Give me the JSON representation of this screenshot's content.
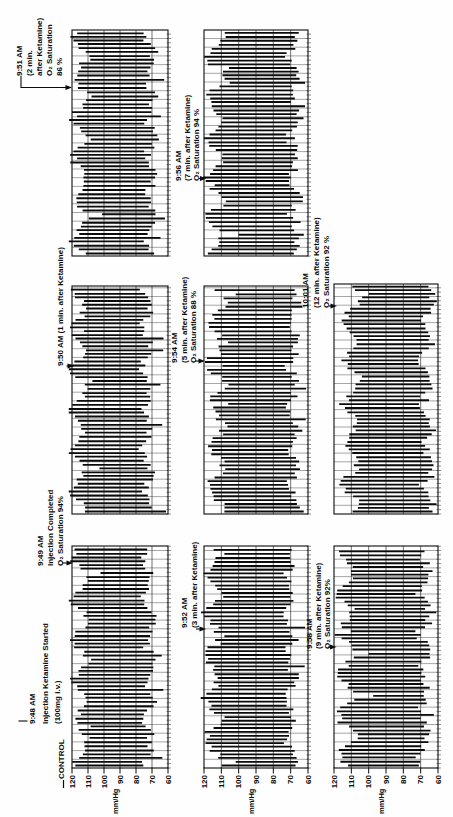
{
  "figure": {
    "y_axis": {
      "unit": "mm/Hg",
      "ticks": [
        120,
        110,
        100,
        90,
        80,
        70,
        60
      ]
    },
    "annotations": {
      "control": {
        "label": "CONTROL"
      },
      "a948": {
        "lines": [
          "9:48 AM",
          "Injection Ketamine Started",
          "(100mg i.v.)"
        ]
      },
      "a949": {
        "lines": [
          "9:49 AM",
          "Injection Completed",
          "O₂ Saturation 94%"
        ]
      },
      "a950": {
        "lines": [
          "9:50 AM (1 min. after Ketamine)"
        ]
      },
      "a951": {
        "lines": [
          "9:51 AM",
          "(2 min.",
          "after Ketamine)",
          "O₂ Saturation",
          "86 %"
        ]
      },
      "a952": {
        "lines": [
          "9:52 AM",
          "(3 min. after Ketamine)"
        ]
      },
      "a954": {
        "lines": [
          "9:54 AM",
          "(5 min. after Ketamine)",
          "O₂ Saturation 88 %"
        ]
      },
      "a956": {
        "lines": [
          "9:56 AM",
          "(7 min. after Ketamine)",
          "O₂ Saturation 94 %"
        ]
      },
      "a958": {
        "lines": [
          "9:58 AM",
          "(9 min. after Ketamine)",
          "O₂ Saturation 92%"
        ]
      },
      "a1001": {
        "lines": [
          "10:01 AM",
          "(12 min. after Ketamine)",
          "O₂ Saturation 92 %"
        ]
      }
    },
    "panels": [
      {
        "row": 1,
        "col": 1,
        "period": "CONTROL / 9:48 AM injection",
        "systolic": 115,
        "diastolic": 72
      },
      {
        "row": 1,
        "col": 2,
        "period": "9:49 AM injection completed",
        "systolic": 116,
        "diastolic": 73
      },
      {
        "row": 1,
        "col": 3,
        "period": "9:50-9:51 AM (1-2 min)",
        "systolic": 115,
        "diastolic": 71
      },
      {
        "row": 2,
        "col": 1,
        "period": "9:52 AM (3 min)",
        "systolic": 115,
        "diastolic": 70
      },
      {
        "row": 2,
        "col": 2,
        "period": "9:54 AM (5 min)",
        "systolic": 113,
        "diastolic": 68
      },
      {
        "row": 2,
        "col": 3,
        "period": "9:56 AM (7 min)",
        "systolic": 114,
        "diastolic": 68
      },
      {
        "row": 3,
        "col": 1,
        "period": "9:58 AM (9 min)",
        "systolic": 113,
        "diastolic": 68
      },
      {
        "row": 3,
        "col": 2,
        "period": "10:01 AM (12 min)",
        "systolic": 110,
        "diastolic": 66
      }
    ],
    "ink_color": "#0b0b0b"
  },
  "chart_data": {
    "type": "line",
    "ylabel": "mm/Hg",
    "ylim": [
      60,
      120
    ],
    "y_ticks": [
      120,
      110,
      100,
      90,
      80,
      70,
      60
    ],
    "x": [
      "CONTROL",
      "9:48 AM",
      "9:49 AM",
      "9:50 AM",
      "9:51 AM",
      "9:52 AM",
      "9:54 AM",
      "9:56 AM",
      "9:58 AM",
      "10:01 AM"
    ],
    "series": [
      {
        "name": "systolic pressure (approx. envelope, mm/Hg)",
        "values": [
          115,
          115,
          116,
          116,
          115,
          115,
          113,
          114,
          113,
          110
        ]
      },
      {
        "name": "diastolic pressure (approx. envelope, mm/Hg)",
        "values": [
          72,
          72,
          73,
          72,
          71,
          70,
          68,
          68,
          68,
          66
        ]
      }
    ],
    "events": [
      {
        "time": "9:48 AM",
        "label": "Injection Ketamine Started (100mg i.v.)"
      },
      {
        "time": "9:49 AM",
        "label": "Injection Completed",
        "o2_saturation_pct": 94
      },
      {
        "time": "9:50 AM",
        "minutes_after_ketamine": 1
      },
      {
        "time": "9:51 AM",
        "minutes_after_ketamine": 2,
        "o2_saturation_pct": 86
      },
      {
        "time": "9:52 AM",
        "minutes_after_ketamine": 3
      },
      {
        "time": "9:54 AM",
        "minutes_after_ketamine": 5,
        "o2_saturation_pct": 88
      },
      {
        "time": "9:56 AM",
        "minutes_after_ketamine": 7,
        "o2_saturation_pct": 94
      },
      {
        "time": "9:58 AM",
        "minutes_after_ketamine": 9,
        "o2_saturation_pct": 92
      },
      {
        "time": "10:01 AM",
        "minutes_after_ketamine": 12,
        "o2_saturation_pct": 92
      }
    ],
    "layout": {
      "rows": 3,
      "panels_per_row": [
        3,
        3,
        2
      ],
      "axis_position": "left of each row",
      "grid": true,
      "orientation_in_image": "landscape figure rotated 90° CCW into portrait scan"
    }
  }
}
